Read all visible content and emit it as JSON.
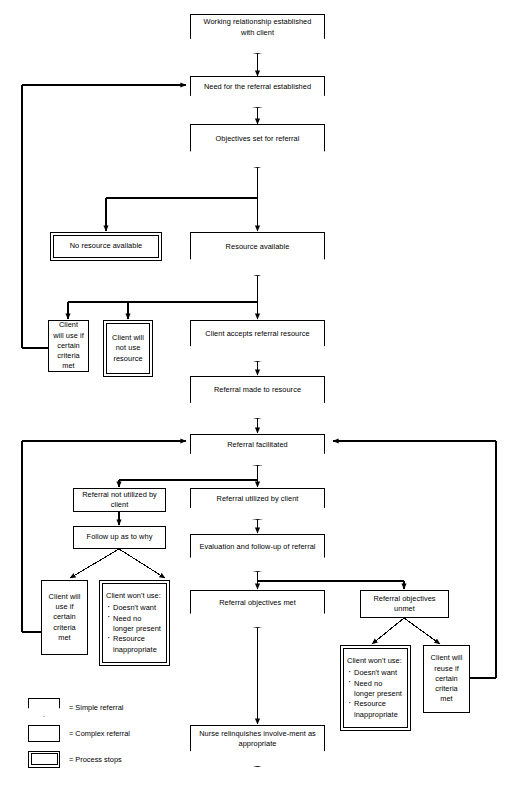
{
  "diagram": {
    "stroke_color": "#000000",
    "background_color": "#ffffff"
  },
  "nodes": {
    "working_relationship": {
      "label": "Working relationship established with client",
      "shape": "simple"
    },
    "need_established": {
      "label": "Need for the referral established",
      "shape": "simple"
    },
    "objectives_set": {
      "label": "Objectives set for referral",
      "shape": "simple"
    },
    "no_resource": {
      "label": "No resource available",
      "shape": "stop"
    },
    "resource_available": {
      "label": "Resource available",
      "shape": "simple"
    },
    "client_will_use_1": {
      "label": "Client will use if certain criteria met",
      "shape": "complex"
    },
    "client_will_not_use": {
      "label": "Client will not use resource",
      "shape": "stop"
    },
    "client_accepts": {
      "label": "Client accepts referral resource",
      "shape": "simple"
    },
    "referral_made": {
      "label": "Referral made to resource",
      "shape": "simple"
    },
    "referral_facilitated": {
      "label": "Referral facilitated",
      "shape": "simple"
    },
    "not_utilized": {
      "label": "Referral not utilized by client",
      "shape": "complex"
    },
    "follow_up": {
      "label": "Follow up as to why",
      "shape": "complex"
    },
    "client_will_use_2": {
      "label": "Client will use if certain criteria met",
      "shape": "complex"
    },
    "wont_use_left": {
      "shape": "stop",
      "heading": "Client won't use:",
      "bullets": [
        "Doesn't want",
        "Need no longer present",
        "Resource inappropriate"
      ]
    },
    "utilized": {
      "label": "Referral utilized by client",
      "shape": "simple"
    },
    "evaluation": {
      "label": "Evaluation and follow-up of referral",
      "shape": "simple"
    },
    "objectives_met": {
      "label": "Referral objectives met",
      "shape": "simple"
    },
    "objectives_unmet": {
      "label": "Referral objectives unmet",
      "shape": "complex"
    },
    "wont_use_right": {
      "shape": "stop",
      "heading": "Client won't use:",
      "bullets": [
        "Doesn't want",
        "Need no longer present",
        "Resource inappropriate"
      ]
    },
    "client_will_reuse": {
      "label": "Client will reuse if certain criteria met",
      "shape": "complex"
    },
    "nurse_relinquishes": {
      "label": "Nurse relinquishes involve-ment as appropriate",
      "shape": "simple"
    }
  },
  "legend": {
    "items": [
      {
        "symbol": "simple",
        "label": "= Simple referral"
      },
      {
        "symbol": "complex",
        "label": "= Complex referral"
      },
      {
        "symbol": "stop",
        "label": "= Process stops"
      }
    ]
  },
  "caption": {
    "text": ""
  }
}
